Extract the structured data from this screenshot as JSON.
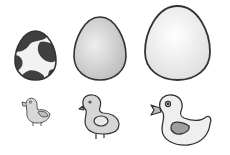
{
  "illustration": {
    "eggs": [
      {
        "name": "spotted-egg",
        "pattern": "spotted",
        "fill": "#f2f2f2",
        "spots": "#404040"
      },
      {
        "name": "medium-egg",
        "pattern": "gradient",
        "fill": "#d0d0d0"
      },
      {
        "name": "large-egg",
        "pattern": "plain",
        "fill": "#f4f4f4"
      }
    ],
    "birds": [
      {
        "name": "small-chick",
        "fill": "#d8d8d8",
        "wing": "#bdbdbd"
      },
      {
        "name": "medium-chick",
        "fill": "#d6d6d6",
        "wing": "#e8e8e8"
      },
      {
        "name": "duck",
        "fill": "#efefef",
        "wing": "#9e9e9e"
      }
    ],
    "colors": {
      "outline": "#333333",
      "background": "#ffffff"
    }
  }
}
